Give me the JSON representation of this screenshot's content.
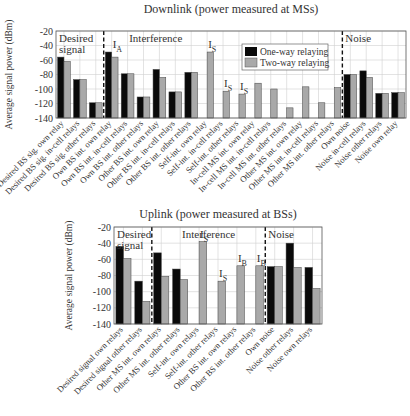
{
  "legend": {
    "one_way": "One-way relaying",
    "two_way": "Two-way relaying"
  },
  "colors": {
    "one_way": "#0a0a0a",
    "two_way": "#a9a9a9",
    "grid": "#d0d0d0",
    "axis": "#555555"
  },
  "chart_data": [
    {
      "type": "bar",
      "title": "Downlink (power measured at MSs)",
      "xlabel": "",
      "ylabel": "Average signal power (dBm)",
      "ylim": [
        -140,
        -20
      ],
      "yticks": [
        -20,
        -40,
        -60,
        -80,
        -100,
        -120,
        -140
      ],
      "grid": true,
      "legend_position": "upper right (inside interference region)",
      "regions": [
        {
          "label": "Desired\nsignal",
          "start": 0,
          "end": 3
        },
        {
          "label": "Interference",
          "start": 3,
          "end": 18
        },
        {
          "label": "Noise",
          "start": 18,
          "end": 22
        }
      ],
      "categories": [
        "Desired BS sig. own relay",
        "Desired BS sig. in-cell relays",
        "Desired BS sig. other relays",
        "Own BS int. own relay",
        "Own BS int. in-cell relays",
        "Own BS int. other relays",
        "Other BS int. own relay",
        "Other BS int. in-cell relays",
        "Other BS int. other relays",
        "Self-int. own relay",
        "Self-int. in-cell relays",
        "Self-int. other relays",
        "In-cell MS int. own relay",
        "In-cell MS int. in-cell relays",
        "In-cell MS int. other relays",
        "Other MS int. own relay",
        "Other MS int. in-cell relays",
        "Other MS int. other relays",
        "Own noise",
        "Noise in-cell relays",
        "Noise other relays",
        "Noise own relay"
      ],
      "series": [
        {
          "name": "One-way relaying",
          "values": [
            -56,
            -87,
            -119,
            -49,
            -79,
            -111,
            -73,
            -104,
            -77,
            null,
            null,
            null,
            null,
            null,
            null,
            null,
            null,
            null,
            -80,
            -75,
            -106,
            -105
          ]
        },
        {
          "name": "Two-way relaying",
          "values": [
            -62,
            -87,
            -119,
            -56,
            -79,
            -111,
            -84,
            -104,
            -77,
            -49,
            -103,
            -107,
            -92,
            -100,
            -126,
            -97,
            -119,
            -98,
            -80,
            -84,
            -106,
            -105
          ]
        }
      ],
      "annotations": [
        {
          "text": "I",
          "sub": "A",
          "category": 3
        },
        {
          "text": "I",
          "sub": "S",
          "category": 9
        },
        {
          "text": "I",
          "sub": "S",
          "category": 10
        },
        {
          "text": "I",
          "sub": "S",
          "category": 11
        }
      ]
    },
    {
      "type": "bar",
      "title": "Uplink (power measured at BSs)",
      "xlabel": "",
      "ylabel": "Average signal power (dBm)",
      "ylim": [
        -140,
        -20
      ],
      "yticks": [
        -20,
        -40,
        -60,
        -80,
        -100,
        -120,
        -140
      ],
      "grid": true,
      "regions": [
        {
          "label": "Desired\nsignal",
          "start": 0,
          "end": 2
        },
        {
          "label": "Interference",
          "start": 2,
          "end": 8
        },
        {
          "label": "Noise",
          "start": 8,
          "end": 11
        }
      ],
      "categories": [
        "Desired signal own relays",
        "Desired signal other relays",
        "Other MS int. own relays",
        "Other MS int. other relays",
        "Self-int. own relays",
        "Self-int. other relays",
        "Other BS int. own relays",
        "Other BS int. other relays",
        "Own noise",
        "Noise other relays",
        "Noise own relays"
      ],
      "series": [
        {
          "name": "One-way relaying",
          "values": [
            -44,
            -87,
            -52,
            -72,
            null,
            null,
            null,
            null,
            -69,
            -40,
            -70
          ]
        },
        {
          "name": "Two-way relaying",
          "values": [
            -59,
            -112,
            -81,
            -85,
            -38,
            -87,
            -68,
            -68,
            -69,
            -70,
            -96
          ]
        }
      ],
      "annotations": [
        {
          "text": "I",
          "sub": "S",
          "category": 4
        },
        {
          "text": "I",
          "sub": "S",
          "category": 5
        },
        {
          "text": "I",
          "sub": "B",
          "category": 6
        },
        {
          "text": "I",
          "sub": "B",
          "category": 7
        }
      ]
    }
  ]
}
